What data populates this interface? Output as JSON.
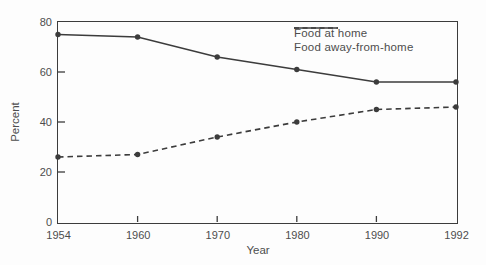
{
  "figure": {
    "y_axis_title": "Percent",
    "x_axis_title": "Year"
  },
  "chart_data": {
    "type": "line",
    "title": "",
    "xlabel": "Year",
    "ylabel": "Percent",
    "categories": [
      "1954",
      "1960",
      "1970",
      "1980",
      "1990",
      "1992"
    ],
    "x_spacing": "even",
    "ylim": [
      0,
      80
    ],
    "y_ticks": [
      0,
      20,
      40,
      60,
      80
    ],
    "grid": false,
    "legend_position": "top-right-inside",
    "series": [
      {
        "name": "Food at home",
        "line_style": "solid",
        "marker": "circle",
        "values": [
          75,
          74,
          66,
          61,
          56,
          56
        ]
      },
      {
        "name": "Food away-from-home",
        "line_style": "dashed",
        "marker": "circle",
        "values": [
          26,
          27,
          34,
          40,
          45,
          46
        ]
      }
    ],
    "colors": {
      "line": "#3c3c3c",
      "text": "#4d4d4d",
      "background": "#fdfdfd"
    }
  }
}
